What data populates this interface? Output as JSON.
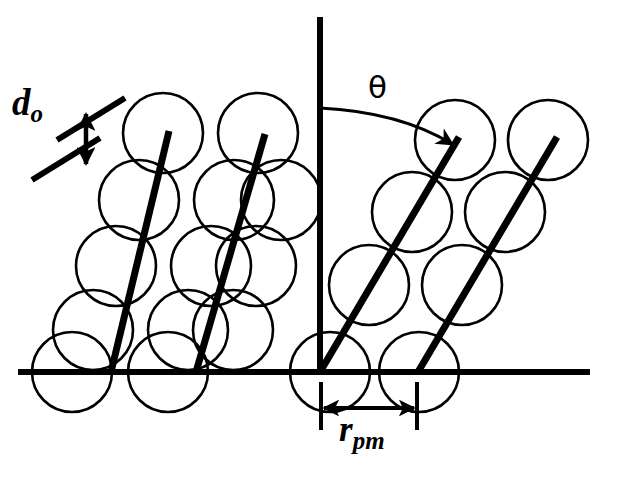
{
  "figure": {
    "domain": "diagram",
    "kind": "crystal-lattice-packing-schematic",
    "background_color": "#ffffff",
    "stroke_color": "#000000",
    "width": 624,
    "height": 479
  },
  "labels": {
    "interplanar_spacing": {
      "base": "d",
      "subscript": "o",
      "full": "d_o",
      "meaning": "interplanar spacing between lattice planes",
      "x": 12,
      "y": 84
    },
    "angle": {
      "symbol": "θ",
      "full": "θ",
      "meaning": "angle between vertical axis and lattice plane direction",
      "x": 368,
      "y": 72
    },
    "projected_spacing": {
      "base": "r",
      "subscript": "pm",
      "full": "r_pm",
      "meaning": "projected spacing measured along the horizontal baseline",
      "x": 339,
      "y": 412
    }
  },
  "axes": {
    "baseline": {
      "x1": 18,
      "y1": 372,
      "x2": 590,
      "y2": 372,
      "stroke_width": 6
    },
    "vertical_axis": {
      "x1": 320,
      "y1": 17,
      "x2": 320,
      "y2": 372,
      "stroke_width": 6
    }
  },
  "left_cluster": {
    "description": "Tilted close-packed rows of spheres; lattice planes steeply inclined, meeting baseline at left",
    "circle_radius": 40,
    "circle_stroke_width": 2.6,
    "circles": [
      {
        "cx": 163,
        "cy": 133
      },
      {
        "cx": 258,
        "cy": 133
      },
      {
        "cx": 139,
        "cy": 200
      },
      {
        "cx": 234,
        "cy": 200
      },
      {
        "cx": 116,
        "cy": 266
      },
      {
        "cx": 211,
        "cy": 266
      },
      {
        "cx": 93,
        "cy": 330
      },
      {
        "cx": 188,
        "cy": 330
      },
      {
        "cx": 72,
        "cy": 372
      },
      {
        "cx": 168,
        "cy": 372
      },
      {
        "cx": 281,
        "cy": 200
      },
      {
        "cx": 256,
        "cy": 266
      },
      {
        "cx": 233,
        "cy": 330
      }
    ],
    "planes": [
      {
        "x1": 169,
        "y1": 131,
        "x2": 111,
        "y2": 372,
        "stroke_width": 7
      },
      {
        "x1": 265,
        "y1": 134,
        "x2": 196,
        "y2": 372,
        "stroke_width": 7
      }
    ]
  },
  "right_cluster": {
    "description": "Close-packed spheres with lattice planes inclined at angle theta from the vertical, first plane originating at the axis origin with an arrowhead",
    "circle_radius": 40,
    "circle_stroke_width": 2.6,
    "circles": [
      {
        "cx": 455,
        "cy": 140
      },
      {
        "cx": 548,
        "cy": 140
      },
      {
        "cx": 412,
        "cy": 212
      },
      {
        "cx": 505,
        "cy": 212
      },
      {
        "cx": 369,
        "cy": 285
      },
      {
        "cx": 462,
        "cy": 285
      },
      {
        "cx": 330,
        "cy": 372
      },
      {
        "cx": 419,
        "cy": 372
      }
    ],
    "planes": [
      {
        "x1": 320,
        "y1": 372,
        "x2": 459,
        "y2": 137,
        "stroke_width": 7,
        "arrow_at": "end"
      },
      {
        "x1": 418,
        "y1": 372,
        "x2": 557,
        "y2": 137,
        "stroke_width": 7,
        "arrow_at": "none"
      }
    ]
  },
  "annotations": {
    "d0_guides": [
      {
        "x1": 57,
        "y1": 140,
        "x2": 125,
        "y2": 98,
        "stroke_width": 6
      },
      {
        "x1": 32,
        "y1": 180,
        "x2": 100,
        "y2": 138,
        "stroke_width": 6
      }
    ],
    "d0_arrow": {
      "x": 86,
      "y_top": 112,
      "y_bottom": 166,
      "stroke_width": 4.5,
      "double_headed": true
    },
    "theta_arc": {
      "cx": 320,
      "cy": 108,
      "start_x": 320,
      "start_y": 108,
      "end_x": 447,
      "end_y": 148,
      "arrow_at": "end"
    },
    "rpm_ticks": [
      {
        "x": 321,
        "y1": 382,
        "y2": 430,
        "stroke_width": 4
      },
      {
        "x": 417,
        "y1": 382,
        "y2": 430,
        "stroke_width": 4
      }
    ],
    "rpm_arrow": {
      "y": 408,
      "x_left": 321,
      "x_right": 417,
      "stroke_width": 4,
      "double_headed": true
    }
  }
}
